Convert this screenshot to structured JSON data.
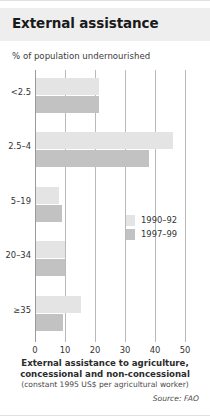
{
  "header": {
    "title": "External assistance"
  },
  "subtitle": "% of population undernourished",
  "legend": {
    "items": [
      {
        "label": "1990–92",
        "color": "#e4e4e4"
      },
      {
        "label": "1997–99",
        "color": "#c2c2c2"
      }
    ]
  },
  "captions": {
    "axis_line1": "External assistance to agriculture,",
    "axis_line2": "concessional and non-concessional",
    "axis_units": "(constant 1995 US$ per agricultural worker)",
    "source": "Source: FAO"
  },
  "chart_data": {
    "type": "bar",
    "orientation": "horizontal",
    "title": "External assistance",
    "subtitle": "% of population undernourished",
    "xlabel": "External assistance to agriculture, concessional and non-concessional (constant 1995 US$ per agricultural worker)",
    "ylabel": "% of population undernourished",
    "categories": [
      "<2.5",
      "2.5–4",
      "5–19",
      "20–34",
      "≥35"
    ],
    "series": [
      {
        "name": "1990–92",
        "color": "#e4e4e4",
        "values": [
          21,
          45.5,
          7.5,
          9.5,
          15
        ]
      },
      {
        "name": "1997–99",
        "color": "#c2c2c2",
        "values": [
          21,
          37.5,
          8.5,
          9.5,
          9
        ]
      }
    ],
    "xlim": [
      0,
      50
    ],
    "xticks": [
      0,
      10,
      20,
      30,
      40,
      50
    ],
    "xtick_labels": [
      "0",
      "10",
      "20",
      "30",
      "40",
      "50"
    ],
    "grid": true,
    "legend_position": "center-right"
  }
}
